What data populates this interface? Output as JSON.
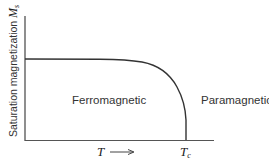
{
  "diagram": {
    "y_axis_label": "Saturation magnetization",
    "y_axis_symbol": "M",
    "y_axis_symbol_sub": "s",
    "x_axis_symbol": "T",
    "x_axis_arrow": "⟶",
    "critical_temp_symbol": "T",
    "critical_temp_sub": "c",
    "region_left": "Ferromagnetic",
    "region_right": "Paramagnetic",
    "line_color": "#333333"
  }
}
